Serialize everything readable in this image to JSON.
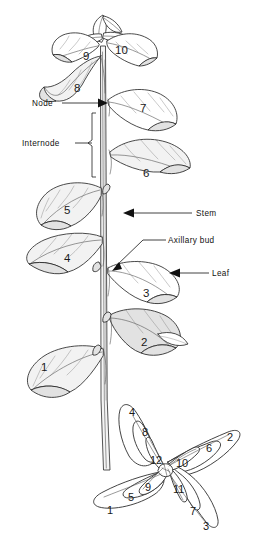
{
  "figure": {
    "background_color": "#ffffff",
    "ink_color": "#1a1a1a"
  },
  "callouts": [
    {
      "label": "Node",
      "name": "callout-node",
      "x": 32,
      "y": 106,
      "line_x1": 62,
      "line_x2": 104,
      "line_y": 103,
      "arrow": true
    },
    {
      "label": "Internode",
      "name": "callout-internode",
      "x": 30,
      "y": 146,
      "line_x1": 80,
      "line_x2": 96,
      "line_y": 143,
      "arrow": false
    },
    {
      "label": "Stem",
      "name": "callout-stem",
      "x": 196,
      "y": 216,
      "line_x1": 190,
      "line_x2": 148,
      "line_y": 213,
      "arrow": true
    },
    {
      "label": "Axillary bud",
      "name": "callout-axillary-bud",
      "x": 168,
      "y": 243,
      "line_x1": 165,
      "line_x2": 121,
      "line_y": 240,
      "arrow": false
    },
    {
      "label": "Leaf",
      "name": "callout-leaf",
      "x": 212,
      "y": 276,
      "line_x1": 208,
      "line_x2": 169,
      "line_y": 273,
      "arrow": true
    }
  ],
  "side_view": {
    "name": "side-view-shoot",
    "leaf_numbers": [
      {
        "value": "10",
        "x": 121,
        "y": 50
      },
      {
        "value": "9",
        "x": 86,
        "y": 56
      },
      {
        "value": "8",
        "x": 78,
        "y": 88
      },
      {
        "value": "7",
        "x": 144,
        "y": 108
      },
      {
        "value": "6",
        "x": 147,
        "y": 173
      },
      {
        "value": "5",
        "x": 68,
        "y": 210
      },
      {
        "value": "4",
        "x": 68,
        "y": 258
      },
      {
        "value": "3",
        "x": 147,
        "y": 293
      },
      {
        "value": "2",
        "x": 145,
        "y": 342
      },
      {
        "value": "1",
        "x": 45,
        "y": 367
      }
    ]
  },
  "top_view": {
    "name": "top-view-rosette",
    "leaf_numbers": [
      {
        "value": "4",
        "x": 133,
        "y": 412
      },
      {
        "value": "8",
        "x": 146,
        "y": 432
      },
      {
        "value": "2",
        "x": 231,
        "y": 437
      },
      {
        "value": "6",
        "x": 210,
        "y": 448
      },
      {
        "value": "12",
        "x": 157,
        "y": 460
      },
      {
        "value": "10",
        "x": 182,
        "y": 463
      },
      {
        "value": "9",
        "x": 148,
        "y": 487
      },
      {
        "value": "11",
        "x": 179,
        "y": 489
      },
      {
        "value": "5",
        "x": 131,
        "y": 497
      },
      {
        "value": "1",
        "x": 110,
        "y": 510
      },
      {
        "value": "7",
        "x": 193,
        "y": 511
      },
      {
        "value": "3",
        "x": 207,
        "y": 526
      }
    ]
  }
}
